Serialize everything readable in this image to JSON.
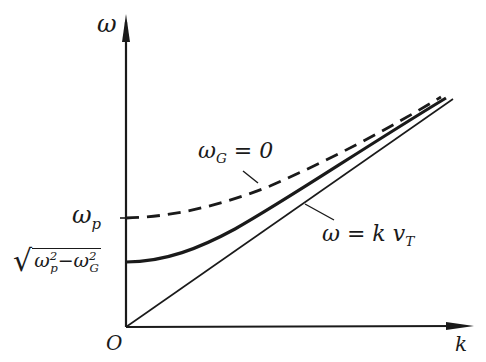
{
  "figure": {
    "type": "dispersion-diagram",
    "axes": {
      "y_label": "ω",
      "x_label": "k",
      "origin_label": "O"
    },
    "y_ticks": [
      {
        "label_base": "ω",
        "label_sub": "p",
        "position": "dashed-curve-intercept"
      },
      {
        "label_base": "√(ω_p² − ω_G²)",
        "position": "solid-curve-intercept"
      }
    ],
    "sqrt_label": {
      "w1": "ω",
      "w1_sub": "p",
      "w1_sup": "2",
      "minus": "−",
      "w2": "ω",
      "w2_sub": "G",
      "w2_sup": "2"
    },
    "omega_p_label": {
      "base": "ω",
      "sub": "p"
    },
    "curves": [
      {
        "name": "ω_G = 0",
        "style": "dashed",
        "intercept": "ω_p"
      },
      {
        "name": "ω² = k²v_T² + ω_p² − ω_G²",
        "style": "solid-thick",
        "intercept": "√(ω_p² − ω_G²)"
      },
      {
        "name": "ω = k v_T",
        "style": "solid-thin",
        "intercept": "0"
      }
    ],
    "annotations": {
      "dashed_curve": {
        "base": "ω",
        "sub": "G",
        "rest": " = 0"
      },
      "asymptote": {
        "lhs": "ω = k v",
        "sub": "T"
      }
    },
    "colors": {
      "ink": "#1a1a1a",
      "background": "#ffffff"
    }
  }
}
